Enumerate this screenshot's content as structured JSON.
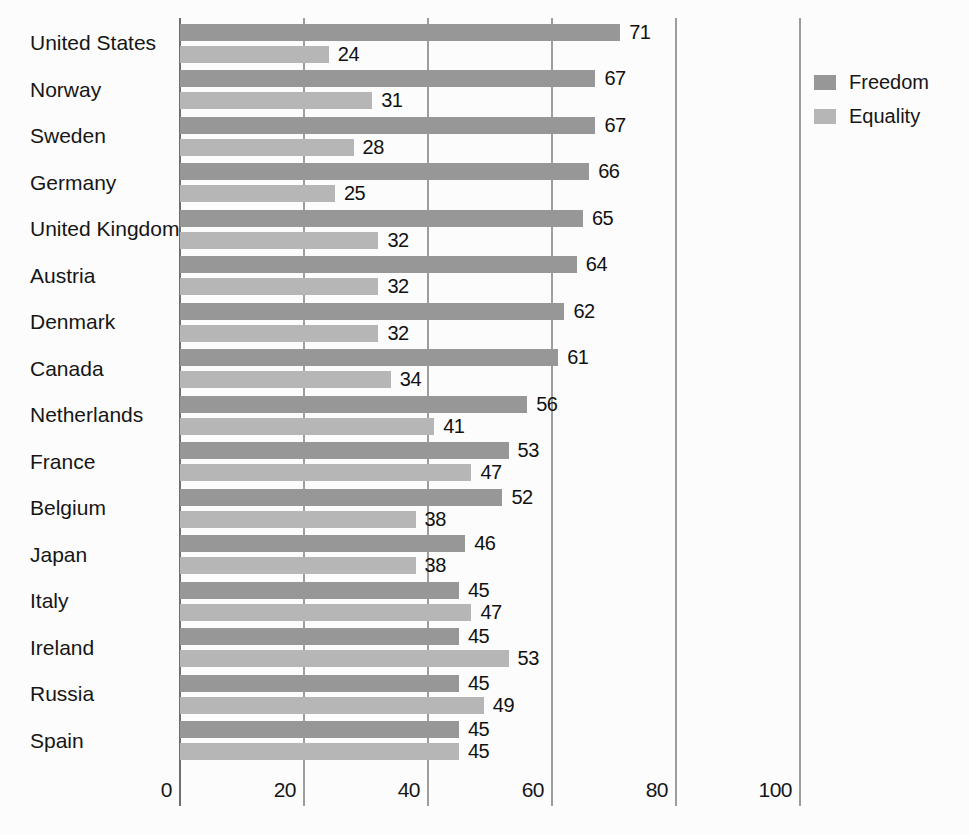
{
  "chart_data": {
    "type": "bar",
    "orientation": "horizontal",
    "title": "",
    "xlabel": "",
    "ylabel": "",
    "categories": [
      "United States",
      "Norway",
      "Sweden",
      "Germany",
      "United Kingdom",
      "Austria",
      "Denmark",
      "Canada",
      "Netherlands",
      "France",
      "Belgium",
      "Japan",
      "Italy",
      "Ireland",
      "Russia",
      "Spain"
    ],
    "series": [
      {
        "name": "Freedom",
        "color": "#979797",
        "values": [
          71,
          67,
          67,
          66,
          65,
          64,
          62,
          61,
          56,
          53,
          52,
          46,
          45,
          45,
          45,
          45
        ]
      },
      {
        "name": "Equality",
        "color": "#b6b6b6",
        "values": [
          24,
          31,
          28,
          25,
          32,
          32,
          32,
          34,
          41,
          47,
          38,
          38,
          47,
          53,
          49,
          45
        ]
      }
    ],
    "value_labels_shown": true,
    "xlim": [
      0,
      100
    ],
    "x_ticks": [
      0,
      20,
      40,
      60,
      80,
      100
    ],
    "grid": "vertical",
    "gridline_color": "#9e9e9e",
    "zero_axis_color": "#6f6f6f",
    "background_color": "#fcfcfc",
    "legend_position": "right"
  }
}
